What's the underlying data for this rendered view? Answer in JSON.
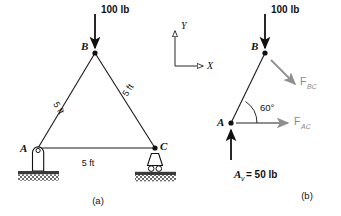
{
  "figure": {
    "panels": [
      {
        "id": "a",
        "caption": "(a)",
        "nodes": [
          {
            "name": "B",
            "label": "B"
          },
          {
            "name": "A",
            "label": "A"
          },
          {
            "name": "C",
            "label": "C"
          }
        ],
        "load": {
          "label": "100 lb",
          "direction": "down"
        },
        "dimensions": [
          {
            "name": "member-ab-length",
            "label": "5 ft"
          },
          {
            "name": "member-bc-length",
            "label": "5 ft"
          },
          {
            "name": "member-ac-length",
            "label": "5 ft"
          }
        ],
        "supports": [
          {
            "name": "pin-support",
            "at": "A"
          },
          {
            "name": "roller-support",
            "at": "C"
          }
        ]
      },
      {
        "id": "b",
        "caption": "(b)",
        "nodes": [
          {
            "name": "B",
            "label": "B"
          },
          {
            "name": "A",
            "label": "A"
          }
        ],
        "load": {
          "label": "100 lb",
          "direction": "down"
        },
        "forces": [
          {
            "name": "F-BC",
            "base": "F",
            "sub": "BC"
          },
          {
            "name": "F-AC",
            "base": "F",
            "sub": "AC"
          }
        ],
        "angle": {
          "label": "60°"
        },
        "reaction": {
          "base": "A",
          "sub": "v",
          "equals": "= 50 lb",
          "full": "Av = 50 lb"
        }
      }
    ],
    "axes": {
      "x_label": "X",
      "y_label": "Y"
    },
    "colors": {
      "line": "#1a1a1a",
      "force": "#8f8f8f",
      "ground": "#3a3a3a",
      "background": "#ffffff"
    }
  }
}
